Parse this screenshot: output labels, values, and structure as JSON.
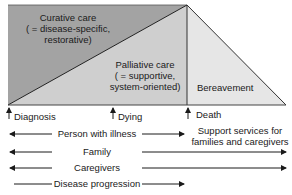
{
  "regions": {
    "curative": {
      "line1": "Curative care",
      "line2": "( = disease-specific,",
      "line3": "restorative)",
      "color": "#a3a3a3"
    },
    "palliative": {
      "line1": "Palliative care",
      "line2": "( = supportive,",
      "line3": "system-oriented)",
      "color": "#cfcfcf"
    },
    "bereavement": {
      "label": "Bereavement",
      "color": "#e6e6e6"
    }
  },
  "timeline": {
    "markers": [
      {
        "label": "Diagnosis"
      },
      {
        "label": "Dying"
      },
      {
        "label": "Death"
      }
    ]
  },
  "rows": [
    {
      "label": "Person with illness",
      "left_arrow": true,
      "right_extent": "death"
    },
    {
      "label": "Family",
      "left_arrow": true,
      "right_extent": "end"
    },
    {
      "label": "Caregivers",
      "left_arrow": true,
      "right_extent": "end"
    },
    {
      "label": "Disease progression",
      "left_arrow": false,
      "right_extent": "death"
    }
  ],
  "support_services": {
    "line1": "Support services for",
    "line2": "families and caregivers"
  }
}
